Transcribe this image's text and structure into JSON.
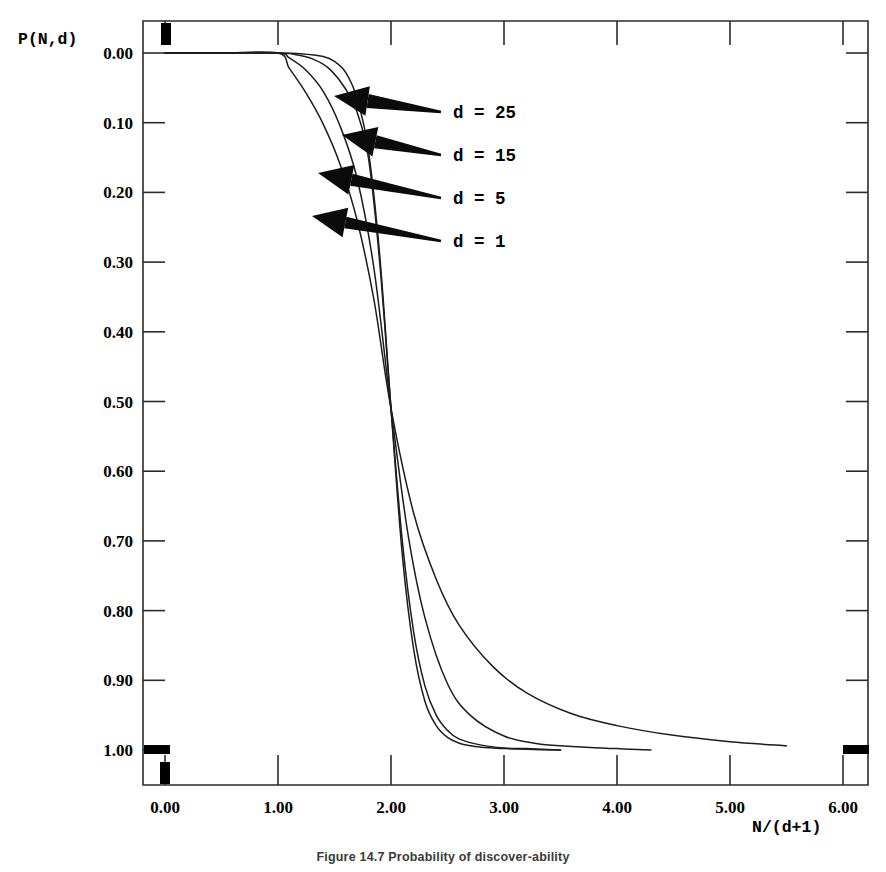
{
  "figure": {
    "caption": "Figure 14.7 Probability of discover-ability"
  },
  "axes": {
    "y_axis_label": "P(N,d)",
    "x_axis_label": "N/(d+1)",
    "y_ticks": [
      "1.00",
      "0.90",
      "0.80",
      "0.70",
      "0.60",
      "0.50",
      "0.40",
      "0.30",
      "0.20",
      "0.10",
      "0.00"
    ],
    "x_ticks": [
      "0.00",
      "1.00",
      "2.00",
      "3.00",
      "4.00",
      "5.00",
      "6.00"
    ]
  },
  "annotations": [
    {
      "label": "d = 25"
    },
    {
      "label": "d = 15"
    },
    {
      "label": "d = 5"
    },
    {
      "label": "d = 1"
    }
  ],
  "colors": {
    "curve": "#1d1d1d",
    "axis": "#2b2b2b",
    "arrow": "#0b0b0b",
    "background": "#ffffff"
  },
  "chart_data": {
    "type": "line",
    "title": "",
    "xlabel": "N/(d+1)",
    "ylabel": "P(N,d)",
    "xlim": [
      0,
      6
    ],
    "ylim": [
      0,
      1
    ],
    "grid": false,
    "legend_position": "in-plot-arrow-annotations",
    "x_ticks": [
      0,
      1,
      2,
      3,
      4,
      5,
      6
    ],
    "y_ticks": [
      0.0,
      0.1,
      0.2,
      0.3,
      0.4,
      0.5,
      0.6,
      0.7,
      0.8,
      0.9,
      1.0
    ],
    "crossing_point": {
      "x": 2.0,
      "y": 0.49
    },
    "series": [
      {
        "name": "d = 25",
        "d": 25,
        "x": [
          0.0,
          0.5,
          1.0,
          1.2,
          1.4,
          1.5,
          1.6,
          1.7,
          1.8,
          1.9,
          2.0,
          2.1,
          2.2,
          2.3,
          2.4,
          2.5,
          2.6,
          2.7,
          2.8,
          2.9,
          3.0,
          3.2,
          3.5
        ],
        "y": [
          1.0,
          1.0,
          1.0,
          0.999,
          0.995,
          0.988,
          0.972,
          0.935,
          0.86,
          0.71,
          0.49,
          0.28,
          0.145,
          0.07,
          0.035,
          0.018,
          0.01,
          0.006,
          0.004,
          0.003,
          0.002,
          0.001,
          0.0
        ]
      },
      {
        "name": "d = 15",
        "d": 15,
        "x": [
          0.0,
          0.5,
          1.0,
          1.15,
          1.3,
          1.45,
          1.6,
          1.7,
          1.8,
          1.9,
          2.0,
          2.1,
          2.2,
          2.3,
          2.4,
          2.5,
          2.6,
          2.8,
          3.0,
          3.2,
          3.5
        ],
        "y": [
          1.0,
          1.0,
          1.0,
          0.998,
          0.992,
          0.978,
          0.948,
          0.915,
          0.85,
          0.7,
          0.49,
          0.3,
          0.17,
          0.092,
          0.05,
          0.028,
          0.016,
          0.007,
          0.003,
          0.002,
          0.0
        ]
      },
      {
        "name": "d = 5",
        "d": 5,
        "x": [
          0.0,
          0.5,
          1.0,
          1.1,
          1.25,
          1.4,
          1.55,
          1.7,
          1.85,
          2.0,
          2.15,
          2.3,
          2.5,
          2.7,
          3.0,
          3.3,
          3.6,
          4.0,
          4.3
        ],
        "y": [
          1.0,
          1.0,
          1.0,
          0.993,
          0.975,
          0.945,
          0.895,
          0.82,
          0.69,
          0.49,
          0.31,
          0.19,
          0.095,
          0.05,
          0.02,
          0.009,
          0.005,
          0.002,
          0.0
        ]
      },
      {
        "name": "d = 1",
        "d": 1,
        "x": [
          0.0,
          0.5,
          1.0,
          1.1,
          1.25,
          1.4,
          1.55,
          1.7,
          1.85,
          2.0,
          2.2,
          2.4,
          2.6,
          2.9,
          3.2,
          3.6,
          4.0,
          4.5,
          5.0,
          5.5
        ],
        "y": [
          1.0,
          1.0,
          1.0,
          0.978,
          0.942,
          0.898,
          0.84,
          0.76,
          0.645,
          0.49,
          0.34,
          0.245,
          0.18,
          0.12,
          0.082,
          0.052,
          0.035,
          0.021,
          0.012,
          0.006
        ]
      }
    ]
  },
  "scan_marks": [
    {
      "name": "top-edge-mark"
    },
    {
      "name": "left-zero-mark"
    },
    {
      "name": "bottom-zero-mark"
    },
    {
      "name": "right-zero-mark"
    }
  ]
}
